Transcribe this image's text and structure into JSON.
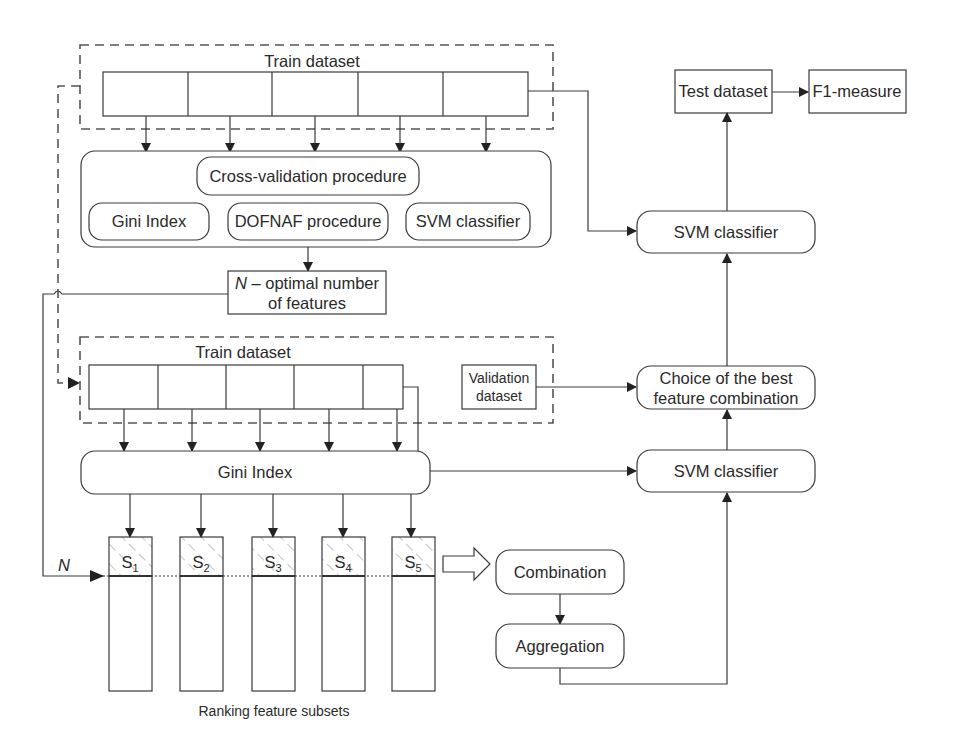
{
  "top_section": {
    "train_dataset_label": "Train dataset",
    "fold_count": 5,
    "cv_container": {
      "title": "Cross-validation procedure",
      "components": [
        "Gini Index",
        "DOFNAF procedure",
        "SVM classifier"
      ]
    },
    "optimal_n": {
      "symbol": "N",
      "line1_rest": " – optimal number",
      "line2": "of features"
    }
  },
  "right_column": {
    "test_dataset": "Test dataset",
    "f1_measure": "F1-measure",
    "svm_top": "SVM classifier",
    "best_choice_line1": "Choice of the best",
    "best_choice_line2": "feature combination",
    "svm_bottom": "SVM classifier"
  },
  "bottom_section": {
    "train_dataset_label": "Train dataset",
    "validation_line1": "Validation",
    "validation_line2": "dataset",
    "gini_index": "Gini Index",
    "subsets": [
      {
        "base": "S",
        "sub": "1"
      },
      {
        "base": "S",
        "sub": "2"
      },
      {
        "base": "S",
        "sub": "3"
      },
      {
        "base": "S",
        "sub": "4"
      },
      {
        "base": "S",
        "sub": "5"
      }
    ],
    "n_marker": "N",
    "combination": "Combination",
    "aggregation": "Aggregation",
    "caption": "Ranking feature subsets"
  },
  "colors": {
    "line": "#3a3a3a",
    "text": "#2a2a2a",
    "hatch": "#8a8a8a",
    "background": "#ffffff"
  }
}
